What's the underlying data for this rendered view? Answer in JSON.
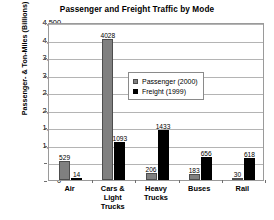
{
  "chart_data": {
    "type": "bar",
    "title": "Passenger and Freight Traffic by Mode",
    "xlabel": "",
    "ylabel": "Passenger- & Ton-Miles (Billions)",
    "categories": [
      "Air",
      "Cars & Light Trucks",
      "Heavy Trucks",
      "Buses",
      "Rail"
    ],
    "series": [
      {
        "name": "Passenger (2000)",
        "color": "#808080",
        "values": [
          529,
          4028,
          206,
          183,
          30
        ]
      },
      {
        "name": "Freight (1999)",
        "color": "#000000",
        "values": [
          14,
          1093,
          1433,
          656,
          618
        ]
      }
    ],
    "ylim": [
      0,
      4500
    ],
    "yticks": [
      0,
      500,
      1000,
      1500,
      2000,
      2500,
      3000,
      3500,
      4000,
      4500
    ],
    "ytick_labels": [
      "0",
      "500",
      "1,000",
      "1,500",
      "2,000",
      "2,500",
      "3,000",
      "3,500",
      "4,000",
      "4,500"
    ],
    "grid": true,
    "legend_position": "inside-upper-center",
    "data_labels": true
  }
}
